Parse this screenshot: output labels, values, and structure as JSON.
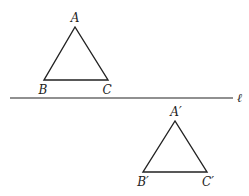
{
  "diagram": {
    "line": {
      "label": "ℓ",
      "x1": 10,
      "y1": 98,
      "x2": 233,
      "y2": 98
    },
    "triangle_original": {
      "vertices": [
        {
          "name": "A",
          "x": 75,
          "y": 27,
          "lx": 75,
          "ly": 22
        },
        {
          "name": "B",
          "x": 44,
          "y": 80,
          "lx": 43,
          "ly": 94
        },
        {
          "name": "C",
          "x": 108,
          "y": 80,
          "lx": 107,
          "ly": 94
        }
      ]
    },
    "triangle_image": {
      "vertices": [
        {
          "name": "A′",
          "x": 175,
          "y": 121,
          "lx": 176,
          "ly": 116
        },
        {
          "name": "B′",
          "x": 143,
          "y": 172,
          "lx": 143,
          "ly": 186
        },
        {
          "name": "C′",
          "x": 207,
          "y": 172,
          "lx": 208,
          "ly": 186
        }
      ]
    },
    "stroke_color": "#222222"
  }
}
